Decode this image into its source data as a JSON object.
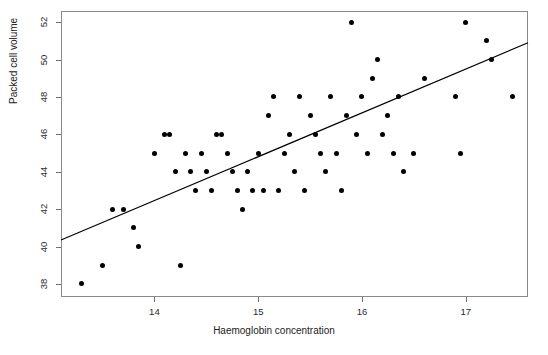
{
  "chart_data": {
    "type": "scatter",
    "title": "",
    "xlabel": "Haemoglobin concentration",
    "ylabel": "Packed cell volume",
    "xlim": [
      13.1,
      17.6
    ],
    "ylim": [
      37.3,
      52.6
    ],
    "xticks": [
      14,
      15,
      16,
      17
    ],
    "yticks": [
      38,
      40,
      42,
      44,
      46,
      48,
      50,
      52
    ],
    "grid": false,
    "legend": null,
    "point_color": "#000000",
    "line_color": "#000000",
    "frame_color": "#8a8a8a",
    "series": [
      {
        "name": "observations",
        "x": [
          13.3,
          13.5,
          13.6,
          13.7,
          13.8,
          13.85,
          14.0,
          14.1,
          14.15,
          14.2,
          14.25,
          14.3,
          14.35,
          14.4,
          14.45,
          14.5,
          14.55,
          14.6,
          14.65,
          14.7,
          14.75,
          14.8,
          14.85,
          14.9,
          14.95,
          15.0,
          15.05,
          15.1,
          15.15,
          15.2,
          15.25,
          15.3,
          15.35,
          15.4,
          15.45,
          15.5,
          15.55,
          15.6,
          15.65,
          15.7,
          15.75,
          15.8,
          15.85,
          15.9,
          15.95,
          16.0,
          16.05,
          16.1,
          16.15,
          16.2,
          16.25,
          16.3,
          16.35,
          16.4,
          16.5,
          16.6,
          16.9,
          16.95,
          17.0,
          17.2,
          17.25,
          17.45
        ],
        "y": [
          38.0,
          39.0,
          42.0,
          42.0,
          41.0,
          40.0,
          45.0,
          46.0,
          46.0,
          44.0,
          39.0,
          45.0,
          44.0,
          43.0,
          45.0,
          44.0,
          43.0,
          46.0,
          46.0,
          45.0,
          44.0,
          43.0,
          42.0,
          44.0,
          43.0,
          45.0,
          43.0,
          47.0,
          48.0,
          43.0,
          45.0,
          46.0,
          44.0,
          48.0,
          43.0,
          47.0,
          46.0,
          45.0,
          44.0,
          48.0,
          45.0,
          43.0,
          47.0,
          52.0,
          46.0,
          48.0,
          45.0,
          49.0,
          50.0,
          46.0,
          47.0,
          45.0,
          48.0,
          44.0,
          45.0,
          49.0,
          48.0,
          45.0,
          52.0,
          51.0,
          50.0,
          48.0
        ],
        "marker": "filled-circle"
      }
    ],
    "fit_line": {
      "type": "linear-regression",
      "x_start": 13.1,
      "y_start": 40.35,
      "x_end": 17.6,
      "y_end": 50.9
    }
  },
  "axes": {
    "y_tick_labels": [
      "52",
      "50",
      "48",
      "46",
      "44",
      "42",
      "40",
      "38"
    ],
    "x_tick_labels": [
      "14",
      "15",
      "16",
      "17"
    ]
  }
}
